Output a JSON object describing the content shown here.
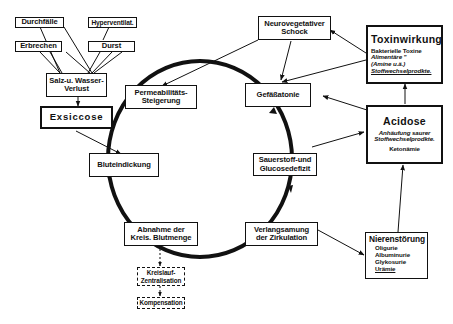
{
  "diagram": {
    "nodes": {
      "durchfaelle": "Durchfälle",
      "hyperventil": "Hyperventilat.",
      "erbrechen": "Erbrechen",
      "durst": "Durst",
      "salz_wasser": [
        "Salz-u. Wasser-",
        "Verlust"
      ],
      "exsiccose": "Exsiccose",
      "permeabilitaet": [
        "Permeabilitäts-",
        "Steigerung"
      ],
      "bluteindickung": "Bluteindickung",
      "abnahme": [
        "Abnahme der",
        "Kreis. Blutmenge"
      ],
      "kreislauf_zentral": [
        "Kreislauf-",
        "Zentralisation"
      ],
      "kompensation": "Kompensation",
      "verlangsamung": [
        "Verlangsamung",
        "der Zirkulation"
      ],
      "sauerstoff": [
        "Sauerstoff-und",
        "Glucosedefizit"
      ],
      "gefaessatonie": "Gefäßatonie",
      "neurovegetativ": [
        "Neurovegetativer",
        "Schock"
      ],
      "toxinwirkung": {
        "title": "Toxinwirkung",
        "lines": [
          "Bakterielle Toxine",
          "Alimentäre  \"",
          "(Amine u.ä.)",
          "Stoffwechselprodkte."
        ]
      },
      "acidose": {
        "title": "Acidose",
        "lines": [
          "Anhäufung saurer",
          "Stoffwechselprodkte.",
          "Ketonämie"
        ]
      },
      "nierenstoerung": {
        "title": "Nierenstörung",
        "lines": [
          "Oligurie",
          "Albuminurie",
          "Glykosurie",
          "Urämie"
        ]
      }
    },
    "edges": [
      {
        "from": "Durchfälle",
        "to": "Salz-u. Wasser-Verlust"
      },
      {
        "from": "Erbrechen",
        "to": "Salz-u. Wasser-Verlust"
      },
      {
        "from": "Hyperventilat.",
        "to": "Salz-u. Wasser-Verlust"
      },
      {
        "from": "Durst",
        "to": "Salz-u. Wasser-Verlust"
      },
      {
        "from": "Salz-u. Wasser-Verlust",
        "to": "Exsiccose"
      },
      {
        "from": "Exsiccose",
        "to": "Bluteindickung"
      },
      {
        "from": "Permeabilitäts-Steigerung",
        "to": "Bluteindickung",
        "style": "cycle"
      },
      {
        "from": "Bluteindickung",
        "to": "Abnahme der Kreis. Blutmenge",
        "style": "cycle"
      },
      {
        "from": "Abnahme der Kreis. Blutmenge",
        "to": "Verlangsamung der Zirkulation",
        "style": "cycle"
      },
      {
        "from": "Verlangsamung der Zirkulation",
        "to": "Sauerstoff-und Glucosedefizit",
        "style": "cycle"
      },
      {
        "from": "Sauerstoff-und Glucosedefizit",
        "to": "Gefäßatonie",
        "style": "cycle"
      },
      {
        "from": "Gefäßatonie",
        "to": "Permeabilitäts-Steigerung",
        "style": "cycle"
      },
      {
        "from": "Abnahme der Kreis. Blutmenge",
        "to": "Kreislauf-Zentralisation",
        "style": "dashed"
      },
      {
        "from": "Kreislauf-Zentralisation",
        "to": "Kompensation",
        "style": "dashed"
      },
      {
        "from": "Neurovegetativer Schock",
        "to": "Gefäßatonie"
      },
      {
        "from": "Neurovegetativer Schock",
        "to": "Permeabilitäts-Steigerung"
      },
      {
        "from": "Toxinwirkung",
        "to": "Neurovegetativer Schock"
      },
      {
        "from": "Toxinwirkung",
        "to": "Gefäßatonie"
      },
      {
        "from": "Acidose",
        "to": "Gefäßatonie"
      },
      {
        "from": "Acidose",
        "to": "Toxinwirkung"
      },
      {
        "from": "Sauerstoff-und Glucosedefizit",
        "to": "Acidose"
      },
      {
        "from": "Verlangsamung der Zirkulation",
        "to": "Nierenstörung"
      },
      {
        "from": "Nierenstörung",
        "to": "Acidose"
      }
    ]
  }
}
